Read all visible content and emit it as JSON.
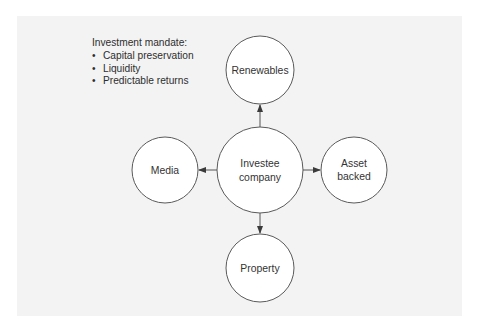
{
  "mandate": {
    "title": "Investment mandate:",
    "items": [
      "Capital preservation",
      "Liquidity",
      "Predictable returns"
    ]
  },
  "nodes": {
    "center": {
      "line1": "Investee",
      "line2": "company"
    },
    "top": {
      "label": "Renewables"
    },
    "left": {
      "label": "Media"
    },
    "right": {
      "line1": "Asset",
      "line2": "backed"
    },
    "bottom": {
      "label": "Property"
    }
  },
  "edges": [
    {
      "from": "Investee company",
      "to": "Renewables"
    },
    {
      "from": "Investee company",
      "to": "Media"
    },
    {
      "from": "Investee company",
      "to": "Asset backed"
    },
    {
      "from": "Investee company",
      "to": "Property"
    }
  ],
  "colors": {
    "panel_bg": "#f3f3f3",
    "node_fill": "#ffffff",
    "node_stroke": "#5a5a5a",
    "text": "#333333"
  }
}
